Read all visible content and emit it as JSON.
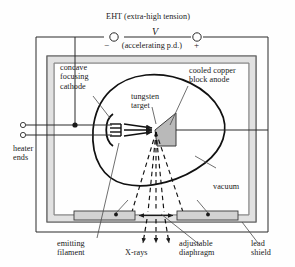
{
  "figure": {
    "colors": {
      "ink": "#1a1a1a",
      "shield_fill": "#d8d8d8",
      "target_fill": "#b9b9b9",
      "diaphragm_fill": "#d0d0d0",
      "background": "#fefefe"
    }
  },
  "supply": {
    "heading": "EHT (extra-high tension)",
    "voltage_symbol": "V",
    "subheading": "(accelerating p.d.)",
    "negative_terminal": "−",
    "positive_terminal": "+"
  },
  "labels": {
    "cathode": "concave\nfocusing\ncathode",
    "anode": "cooled copper\nblock anode",
    "target": "tungsten\ntarget",
    "heater": "heater\nends",
    "vacuum": "vacuum",
    "filament": "emitting\nfilament",
    "xrays": "X-rays",
    "diaphragm": "adjustable\ndiaphragm",
    "shield": "lead\nshield"
  },
  "parts": [
    {
      "name": "concave-focusing-cathode",
      "label": "concave focusing cathode"
    },
    {
      "name": "emitting-filament",
      "label": "emitting filament"
    },
    {
      "name": "tungsten-target",
      "label": "tungsten target"
    },
    {
      "name": "cooled-copper-block-anode",
      "label": "cooled copper block anode"
    },
    {
      "name": "adjustable-diaphragm",
      "label": "adjustable diaphragm"
    },
    {
      "name": "lead-shield",
      "label": "lead shield"
    },
    {
      "name": "vacuum-envelope",
      "label": "vacuum"
    },
    {
      "name": "heater-ends",
      "label": "heater ends"
    },
    {
      "name": "x-ray-beam",
      "label": "X-rays"
    }
  ]
}
